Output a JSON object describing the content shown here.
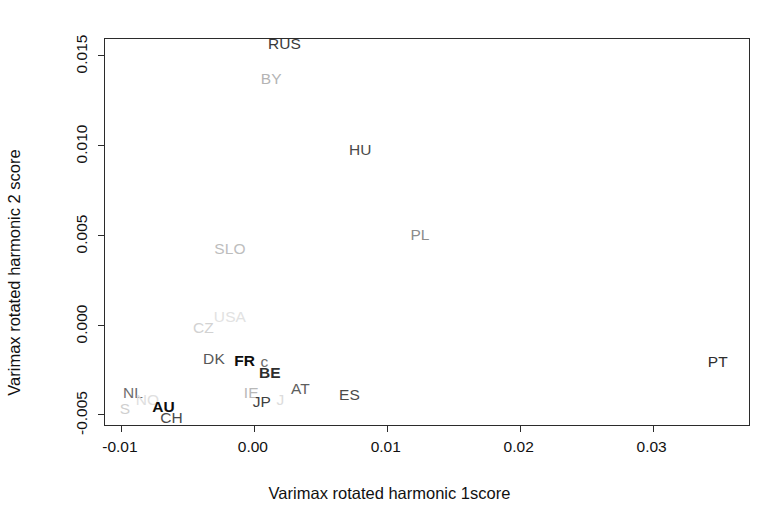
{
  "chart_data": {
    "type": "scatter",
    "title": "",
    "xlabel": "Varimax rotated harmonic 1score",
    "ylabel": "Varimax rotated harmonic 2 score",
    "xlim": [
      -0.0112,
      0.0374
    ],
    "ylim": [
      -0.0057,
      0.0159
    ],
    "xticks": [
      -0.01,
      0.0,
      0.01,
      0.02,
      0.03
    ],
    "xticklabels": [
      "-0.01",
      "0.00",
      "0.01",
      "0.02",
      "0.03"
    ],
    "yticks": [
      -0.005,
      0.0,
      0.005,
      0.01,
      0.015
    ],
    "yticklabels": [
      "-0.005",
      "0.000",
      "0.005",
      "0.010",
      "0.015"
    ],
    "grid": false,
    "legend": null,
    "marker_style": "text-label",
    "points": [
      {
        "label": "RUS",
        "x": 0.0023,
        "y": 0.0156,
        "color": "#3a3a3a",
        "weight": "normal",
        "size": 15.5
      },
      {
        "label": "BY",
        "x": 0.0013,
        "y": 0.0137,
        "color": "#b4b4b4",
        "weight": "normal",
        "size": 15.5
      },
      {
        "label": "HU",
        "x": 0.008,
        "y": 0.0097,
        "color": "#4a4a4a",
        "weight": "normal",
        "size": 15.5
      },
      {
        "label": "PL",
        "x": 0.0125,
        "y": 0.005,
        "color": "#8c8c8c",
        "weight": "normal",
        "size": 15.5
      },
      {
        "label": "SLO",
        "x": -0.0018,
        "y": 0.0042,
        "color": "#bdbdbd",
        "weight": "normal",
        "size": 15.5
      },
      {
        "label": "USA",
        "x": -0.0018,
        "y": 0.0004,
        "color": "#e2e2e2",
        "weight": "normal",
        "size": 15.5
      },
      {
        "label": "CZ",
        "x": -0.0038,
        "y": -0.0002,
        "color": "#d2d2d2",
        "weight": "normal",
        "size": 15.5
      },
      {
        "label": "DK",
        "x": -0.003,
        "y": -0.0019,
        "color": "#575757",
        "weight": "normal",
        "size": 15.5
      },
      {
        "label": "FR",
        "x": -0.0007,
        "y": -0.002,
        "color": "#0d0d0d",
        "weight": "bold",
        "size": 15.5
      },
      {
        "label": "c",
        "x": 0.0008,
        "y": -0.0021,
        "color": "#6b6b6b",
        "weight": "normal",
        "size": 15.5
      },
      {
        "label": "BE",
        "x": 0.0012,
        "y": -0.0027,
        "color": "#2e2e2e",
        "weight": "bold",
        "size": 15.5
      },
      {
        "label": "AT",
        "x": 0.0035,
        "y": -0.0036,
        "color": "#5e5e5e",
        "weight": "normal",
        "size": 15.5
      },
      {
        "label": "ES",
        "x": 0.0072,
        "y": -0.0039,
        "color": "#4a4a4a",
        "weight": "normal",
        "size": 15.5
      },
      {
        "label": "PT",
        "x": 0.0349,
        "y": -0.0021,
        "color": "#2e2e2e",
        "weight": "normal",
        "size": 15.5
      },
      {
        "label": "NL",
        "x": -0.0091,
        "y": -0.0038,
        "color": "#6e6e6e",
        "weight": "normal",
        "size": 15.5
      },
      {
        "label": "NO",
        "x": -0.008,
        "y": -0.0042,
        "color": "#e0e0e0",
        "weight": "normal",
        "size": 15.5
      },
      {
        "label": "IE",
        "x": -0.0002,
        "y": -0.0038,
        "color": "#b8b8b8",
        "weight": "normal",
        "size": 15.5
      },
      {
        "label": "JP",
        "x": 0.0006,
        "y": -0.0043,
        "color": "#3f3f3f",
        "weight": "normal",
        "size": 15.5
      },
      {
        "label": "J",
        "x": 0.002,
        "y": -0.0042,
        "color": "#dcdcdc",
        "weight": "normal",
        "size": 15.5
      },
      {
        "label": "S",
        "x": -0.0097,
        "y": -0.0047,
        "color": "#cfcfcf",
        "weight": "normal",
        "size": 15.5
      },
      {
        "label": "AU",
        "x": -0.0068,
        "y": -0.0046,
        "color": "#0d0d0d",
        "weight": "bold",
        "size": 15.5
      },
      {
        "label": "CH",
        "x": -0.0062,
        "y": -0.0052,
        "color": "#4a4a4a",
        "weight": "normal",
        "size": 15.5
      }
    ]
  }
}
